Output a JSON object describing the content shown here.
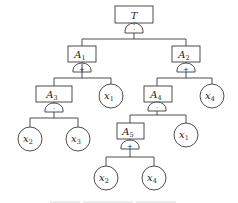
{
  "diagram": {
    "type": "fault-tree",
    "colors": {
      "stroke": "#3a3a3a",
      "text": "#222222",
      "background": "#ffffff"
    },
    "events": [
      {
        "id": "T",
        "label": "T",
        "sub": "",
        "shape": "rect",
        "gate": "AND",
        "gate_symbol": "·"
      },
      {
        "id": "A1",
        "label": "A",
        "sub": "1",
        "shape": "rect",
        "gate": "OR",
        "gate_symbol": "+"
      },
      {
        "id": "A2",
        "label": "A",
        "sub": "2",
        "shape": "rect",
        "gate": "OR",
        "gate_symbol": "+"
      },
      {
        "id": "A3",
        "label": "A",
        "sub": "3",
        "shape": "rect",
        "gate": "AND",
        "gate_symbol": "·"
      },
      {
        "id": "A4",
        "label": "A",
        "sub": "4",
        "shape": "rect",
        "gate": "AND",
        "gate_symbol": "·"
      },
      {
        "id": "A5",
        "label": "A",
        "sub": "5",
        "shape": "rect",
        "gate": "OR",
        "gate_symbol": "+"
      }
    ],
    "basic_events": [
      {
        "id": "x1_a",
        "label": "x",
        "sub": "1",
        "parent": "A1"
      },
      {
        "id": "x2_a",
        "label": "x",
        "sub": "2",
        "parent": "A3"
      },
      {
        "id": "x3",
        "label": "x",
        "sub": "3",
        "parent": "A3"
      },
      {
        "id": "x4_a",
        "label": "x",
        "sub": "4",
        "parent": "A2"
      },
      {
        "id": "x1_b",
        "label": "x",
        "sub": "1",
        "parent": "A4"
      },
      {
        "id": "x2_b",
        "label": "x",
        "sub": "2",
        "parent": "A5"
      },
      {
        "id": "x4_b",
        "label": "x",
        "sub": "4",
        "parent": "A5"
      }
    ],
    "edges": [
      [
        "T",
        "A1"
      ],
      [
        "T",
        "A2"
      ],
      [
        "A1",
        "A3"
      ],
      [
        "A1",
        "x1_a"
      ],
      [
        "A2",
        "A4"
      ],
      [
        "A2",
        "x4_a"
      ],
      [
        "A3",
        "x2_a"
      ],
      [
        "A3",
        "x3"
      ],
      [
        "A4",
        "A5"
      ],
      [
        "A4",
        "x1_b"
      ],
      [
        "A5",
        "x2_b"
      ],
      [
        "A5",
        "x4_b"
      ]
    ]
  }
}
